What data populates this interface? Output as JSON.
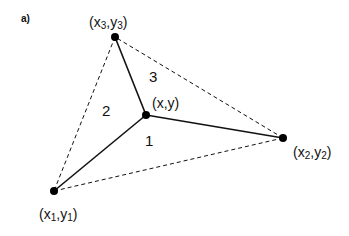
{
  "figure": {
    "panel_label": "a)",
    "colors": {
      "line": "#111111",
      "dot": "#000000",
      "background": "#ffffff"
    },
    "vertices": [
      {
        "id": "p1",
        "base_x": "x",
        "sub_x": "1",
        "base_y": "y",
        "sub_y": "1",
        "label": "(x1,y1)",
        "px": [
          54,
          191
        ]
      },
      {
        "id": "p2",
        "base_x": "x",
        "sub_x": "2",
        "base_y": "y",
        "sub_y": "2",
        "label": "(x2,y2)",
        "px": [
          283,
          138
        ]
      },
      {
        "id": "p3",
        "base_x": "x",
        "sub_x": "3",
        "base_y": "y",
        "sub_y": "3",
        "label": "(x3,y3)",
        "px": [
          115,
          37
        ]
      }
    ],
    "interior_point": {
      "label": "(x,y)",
      "px": [
        146,
        115
      ]
    },
    "regions": [
      {
        "id": "1",
        "label": "1"
      },
      {
        "id": "2",
        "label": "2"
      },
      {
        "id": "3",
        "label": "3"
      }
    ],
    "edges": {
      "solid": [
        "p-p1",
        "p-p2",
        "p-p3"
      ],
      "dashed": [
        "p1-p2",
        "p2-p3",
        "p3-p1"
      ]
    }
  }
}
